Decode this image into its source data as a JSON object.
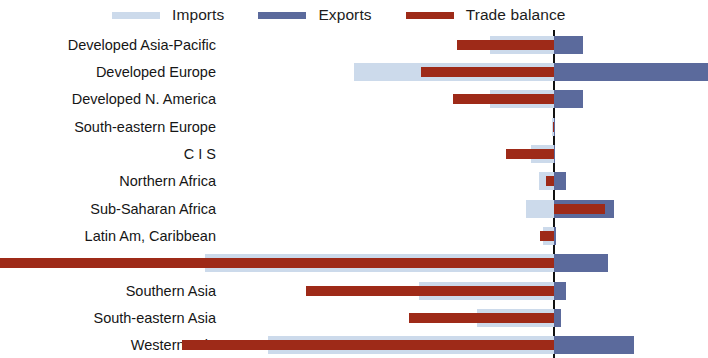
{
  "legend": {
    "position": "top",
    "entries": [
      {
        "label": "Imports",
        "color": "#ccdaeb",
        "key": "imports"
      },
      {
        "label": "Exports",
        "color": "#5b6a9c",
        "key": "exports"
      },
      {
        "label": "Trade balance",
        "color": "#9e2a18",
        "key": "balance"
      }
    ]
  },
  "colors": {
    "imports": "#ccdaeb",
    "exports": "#5b6a9c",
    "balance": "#9e2a18",
    "zero_line": "#111111",
    "background": "#ffffff",
    "text": "#161616"
  },
  "edge_text": "pa",
  "chart_data": {
    "type": "bar",
    "orientation": "horizontal",
    "title": "",
    "subtitle": "",
    "xlabel": "",
    "ylabel": "",
    "grid": false,
    "legend_position": "top",
    "axis_note": "Diverging horizontal bars about a zero line; imports drawn to the left (negative), exports to the right (positive), trade balance overlaid as a narrow bar spanning from the balance value to zero.",
    "xlim": [
      -100,
      46
    ],
    "zero_at_fraction": 0.685,
    "categories": [
      "Developed Asia-Pacific",
      "Developed Europe",
      "Developed N. America",
      "South-eastern Europe",
      "C I S",
      "Northern Africa",
      "Sub-Saharan Africa",
      "Latin Am, Caribbean",
      "Eastern Asia",
      "Southern Asia",
      "South-eastern Asia",
      "Western Asia"
    ],
    "series": [
      {
        "name": "Imports",
        "key": "imports",
        "color": "#ccdaeb",
        "values": [
          -12.2,
          -38.0,
          -12.2,
          -0.4,
          -4.4,
          -2.8,
          -5.4,
          -2.0,
          -66.4,
          -25.6,
          -14.6,
          -54.4
        ]
      },
      {
        "name": "Exports",
        "key": "exports",
        "color": "#5b6a9c",
        "values": [
          8.8,
          47.4,
          8.8,
          0.3,
          0.4,
          3.6,
          18.6,
          0.6,
          16.6,
          3.6,
          2.2,
          24.6
        ]
      },
      {
        "name": "Trade balance",
        "key": "balance",
        "color": "#9e2a18",
        "values": [
          -18.4,
          -25.2,
          -19.2,
          -0.2,
          -9.2,
          -1.6,
          15.6,
          -2.6,
          -112.8,
          -47.2,
          -27.6,
          -70.8
        ]
      }
    ]
  }
}
